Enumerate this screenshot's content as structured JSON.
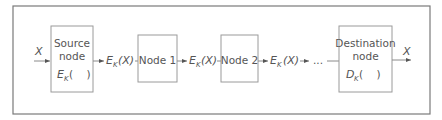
{
  "diagram": {
    "type": "encryption-pipeline",
    "input_label": "X",
    "output_label": "X",
    "ellipsis": "...",
    "nodes": [
      {
        "id": "source",
        "line1": "Source",
        "line2": "node",
        "func": "E",
        "func_sub": "K",
        "func_args": "(    )"
      },
      {
        "id": "node1",
        "label": "Node 1"
      },
      {
        "id": "node2",
        "label": "Node 2"
      },
      {
        "id": "destination",
        "line1": "Destination",
        "line2": "node",
        "func": "D",
        "func_sub": "K",
        "func_args": "(    )"
      }
    ],
    "edges": [
      {
        "label_main": "E",
        "label_sub": "K",
        "label_arg": "(X)"
      },
      {
        "label_main": "E",
        "label_sub": "K",
        "label_arg": "(X)"
      },
      {
        "label_main": "E",
        "label_sub": "K",
        "label_arg": "(X)"
      }
    ],
    "colors": {
      "line": "#8a8a8a",
      "text": "#555555",
      "background": "#ffffff"
    }
  }
}
